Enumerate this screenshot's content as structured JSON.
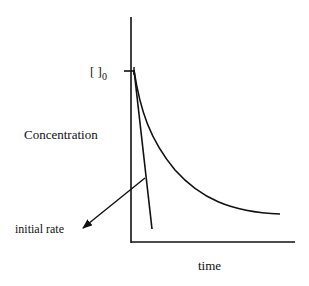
{
  "diagram": {
    "type": "concentration-vs-time",
    "y_axis_label": "Concentration",
    "x_axis_label": "time",
    "initial_marker_label": "[ ]",
    "initial_marker_subscript": "0",
    "annotation": "initial rate",
    "line_color": "#111111",
    "background": "#ffffff"
  }
}
